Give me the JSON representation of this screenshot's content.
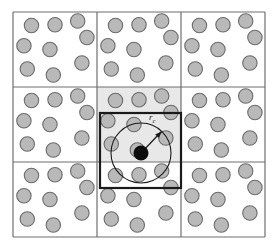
{
  "figure": {
    "name": "periodic-boundary-minimum-image-cutoff",
    "canvas": {
      "width": 277,
      "height": 251
    },
    "background_color": "#ffffff"
  },
  "grid": {
    "name": "periodic-image-grid",
    "rows": 3,
    "cols": 3,
    "x": 13,
    "y": 12,
    "cell_width": 84,
    "cell_height": 75,
    "line_color": "#6f6f6f",
    "line_width": 1.2,
    "cells": [
      {
        "row": 0,
        "col": 0,
        "shaded": false,
        "label": "image-cell-top-left"
      },
      {
        "row": 0,
        "col": 1,
        "shaded": false,
        "label": "image-cell-top-center"
      },
      {
        "row": 0,
        "col": 2,
        "shaded": false,
        "label": "image-cell-top-right"
      },
      {
        "row": 1,
        "col": 0,
        "shaded": false,
        "label": "image-cell-middle-left"
      },
      {
        "row": 1,
        "col": 1,
        "shaded": true,
        "label": "primary-cell-center"
      },
      {
        "row": 1,
        "col": 2,
        "shaded": false,
        "label": "image-cell-middle-right"
      },
      {
        "row": 2,
        "col": 0,
        "shaded": false,
        "label": "image-cell-bottom-left"
      },
      {
        "row": 2,
        "col": 1,
        "shaded": false,
        "label": "image-cell-bottom-center"
      },
      {
        "row": 2,
        "col": 2,
        "shaded": false,
        "label": "image-cell-bottom-right"
      }
    ],
    "shaded_fill": "#e8e8e8"
  },
  "particles": {
    "name": "particle-layout",
    "radius": 7.2,
    "fill": "#b9b9b9",
    "stroke": "#6b6b6b",
    "stroke_width": 1.1,
    "count_per_cell": 9,
    "positions_fraction": [
      {
        "fx": 0.22,
        "fy": 0.18
      },
      {
        "fx": 0.5,
        "fy": 0.17
      },
      {
        "fx": 0.77,
        "fy": 0.12
      },
      {
        "fx": 0.88,
        "fy": 0.34
      },
      {
        "fx": 0.13,
        "fy": 0.45
      },
      {
        "fx": 0.44,
        "fy": 0.5
      },
      {
        "fx": 0.82,
        "fy": 0.68
      },
      {
        "fx": 0.17,
        "fy": 0.76
      },
      {
        "fx": 0.48,
        "fy": 0.84
      }
    ]
  },
  "tagged_particle": {
    "name": "tagged-particle",
    "cx": 141,
    "cy": 153,
    "r": 7.5,
    "fill": "#0d0d0d"
  },
  "cutoff_circle": {
    "name": "cutoff-radius-circle",
    "cx": 141,
    "cy": 153,
    "r": 30,
    "stroke": "#1a1a1a",
    "stroke_width": 1.1,
    "fill": "none"
  },
  "cutoff_arrow": {
    "name": "cutoff-radius-arrow",
    "x1": 141,
    "y1": 153,
    "x2": 161.5,
    "y2": 131.5,
    "stroke": "#1a1a1a",
    "stroke_width": 1.2
  },
  "cutoff_label": {
    "name": "cutoff-radius-label",
    "symbol": "r",
    "subscript": "c",
    "x": 149,
    "y": 120
  },
  "minimum_image_box": {
    "name": "minimum-image-box",
    "x": 100,
    "y": 113,
    "width": 81,
    "height": 75,
    "stroke": "#1a1a1a",
    "stroke_width": 2.2,
    "fill": "none"
  }
}
